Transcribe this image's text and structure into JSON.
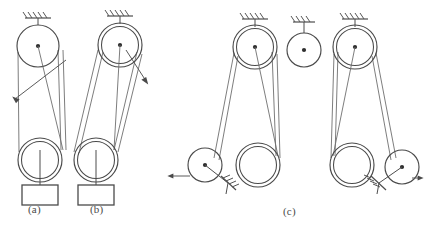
{
  "figure": {
    "background": "#ffffff",
    "width": 424,
    "height": 228,
    "line_color": "#4d4d4d",
    "belt_color": "#6e6e6e",
    "hub_color": "#2e2e2e",
    "caption_color": "#4a4a4a"
  },
  "captions": {
    "a": "(a)",
    "b": "(b)",
    "c": "(c)"
  },
  "panels": [
    {
      "id": "a",
      "label": "(a)",
      "label_x": 33,
      "label_y": 210,
      "description": "Open belt drive: single-groove driver pulley fixed to ground above, double-rim driven pulley below carrying a suspended weight, belt free end drawn off to the upper left.",
      "ground_support": {
        "x": 38,
        "y": 17,
        "width": 26,
        "hatch_count": 5
      },
      "pulleys": [
        {
          "name": "driver-pulley",
          "cx": 38,
          "cy": 46,
          "r": 21,
          "rims": 1,
          "hub": true
        },
        {
          "name": "driven-pulley",
          "cx": 40,
          "cy": 160,
          "r": 22,
          "rims": 2,
          "hub": false
        }
      ],
      "weight": {
        "x": 22,
        "y": 185,
        "width": 36,
        "height": 20
      },
      "hanger": {
        "x": 40,
        "y_top": 150,
        "y_bottom": 185
      },
      "arrow": {
        "from_x": 66,
        "from_y": 60,
        "to_x": 13,
        "to_y": 96,
        "direction": "up-left"
      }
    },
    {
      "id": "b",
      "label": "(b)",
      "label_x": 95,
      "label_y": 210,
      "description": "Crossed belt drive: double-rim driver pulley fixed to ground above, double-rim driven pulley below carrying a suspended weight, belt free end drawn off to the lower right.",
      "ground_support": {
        "x": 120,
        "y": 15,
        "width": 26,
        "hatch_count": 5
      },
      "pulleys": [
        {
          "name": "driver-pulley",
          "cx": 120,
          "cy": 45,
          "r": 22,
          "rims": 2,
          "hub": true
        },
        {
          "name": "driven-pulley",
          "cx": 96,
          "cy": 160,
          "r": 22,
          "rims": 2,
          "hub": false
        }
      ],
      "weight": {
        "x": 78,
        "y": 185,
        "width": 36,
        "height": 20
      },
      "hanger": {
        "x": 96,
        "y_top": 150,
        "y_bottom": 185
      },
      "arrow": {
        "from_x": 126,
        "from_y": 52,
        "to_x": 147,
        "to_y": 83,
        "direction": "down-right"
      }
    },
    {
      "id": "c",
      "label": "(c)",
      "label_x": 288,
      "label_y": 212,
      "description": "Symmetric twin belt drive: two double-rim upper pulleys flank a single central idler pulley, all fixed to ground; each drives a lower double-rim pulley, with slider-crank linkages at the outer ends showing opposed output arrows.",
      "ground_supports": [
        {
          "x": 255,
          "y": 18,
          "width": 26,
          "hatch_count": 5
        },
        {
          "x": 304,
          "y": 20,
          "width": 22,
          "hatch_count": 4
        },
        {
          "x": 355,
          "y": 18,
          "width": 26,
          "hatch_count": 5
        }
      ],
      "pulleys": [
        {
          "name": "left-upper-pulley",
          "cx": 255,
          "cy": 47,
          "r": 22,
          "rims": 2,
          "hub": true
        },
        {
          "name": "center-idler-pulley",
          "cx": 304,
          "cy": 50,
          "r": 17,
          "rims": 1,
          "hub": true
        },
        {
          "name": "right-upper-pulley",
          "cx": 355,
          "cy": 47,
          "r": 22,
          "rims": 2,
          "hub": true
        },
        {
          "name": "left-lower-pulley",
          "cx": 258,
          "cy": 165,
          "r": 22,
          "rims": 2,
          "hub": false
        },
        {
          "name": "right-lower-pulley",
          "cx": 352,
          "cy": 165,
          "r": 22,
          "rims": 2,
          "hub": false
        }
      ],
      "cranks": [
        {
          "name": "left-crank",
          "cx": 205,
          "cy": 165,
          "r": 17,
          "hub": true,
          "rod_to_x": 228,
          "rod_to_y": 183,
          "pivot_x": 228,
          "pivot_y": 183,
          "arrow": {
            "from_x": 188,
            "from_y": 176,
            "to_x": 168,
            "to_y": 176,
            "direction": "left"
          }
        },
        {
          "name": "right-crank",
          "cx": 402,
          "cy": 167,
          "r": 17,
          "hub": true,
          "rod_to_x": 379,
          "rod_to_y": 183,
          "pivot_x": 379,
          "pivot_y": 183,
          "arrow": {
            "from_x": 414,
            "from_y": 178,
            "to_x": 423,
            "to_y": 178,
            "direction": "right"
          }
        }
      ]
    }
  ]
}
